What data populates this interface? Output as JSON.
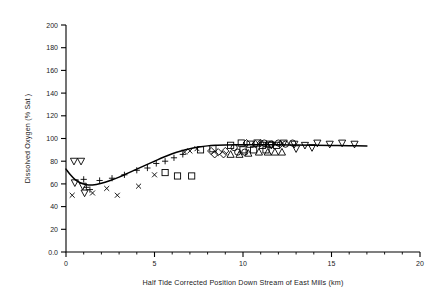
{
  "chart_data": {
    "type": "scatter",
    "title": "",
    "subtitle": "",
    "xlabel": "Half Tide Corrected Position Down Stream of East Mills (km)",
    "ylabel": "Dissolved Oxygen (% Sat )",
    "xlim": [
      0,
      20
    ],
    "ylim": [
      0,
      200
    ],
    "xticks": [
      0,
      5,
      10,
      15,
      20
    ],
    "xtick_labels": [
      "0",
      "5",
      "10",
      "15",
      "20"
    ],
    "yticks": [
      0,
      20,
      40,
      60,
      80,
      100,
      120,
      140,
      160,
      180,
      200
    ],
    "ytick_labels": [
      "0.0",
      "20-",
      "40-",
      "60-",
      "80-",
      "100-",
      "120-",
      "140-",
      "160-",
      "180-",
      "200-"
    ],
    "ytick_text": [
      "0.0",
      "20",
      "40",
      "60",
      "80",
      "100",
      "120",
      "140",
      "160",
      "180",
      "200"
    ],
    "grid": false,
    "legend": "none",
    "xminor_step": 1,
    "series": [
      {
        "name": "down-triangle",
        "marker": "triangle-down",
        "points": [
          [
            0.45,
            80
          ],
          [
            0.85,
            80
          ],
          [
            0.5,
            61
          ],
          [
            0.95,
            58
          ],
          [
            1.05,
            52
          ],
          [
            12.3,
            96
          ],
          [
            12.9,
            95
          ],
          [
            13.5,
            94
          ],
          [
            14.2,
            96
          ],
          [
            14.9,
            95
          ],
          [
            15.6,
            96
          ],
          [
            16.3,
            95
          ],
          [
            11.6,
            94
          ],
          [
            13.0,
            91
          ],
          [
            13.9,
            92
          ]
        ]
      },
      {
        "name": "plus",
        "marker": "plus",
        "points": [
          [
            1.0,
            64
          ],
          [
            1.15,
            57
          ],
          [
            1.35,
            55
          ],
          [
            1.9,
            63
          ],
          [
            2.6,
            65
          ],
          [
            3.3,
            68
          ],
          [
            4.0,
            72
          ],
          [
            4.6,
            74
          ],
          [
            5.1,
            78
          ],
          [
            5.6,
            80
          ],
          [
            6.1,
            83
          ],
          [
            6.6,
            86
          ]
        ]
      },
      {
        "name": "cross",
        "marker": "cross",
        "points": [
          [
            0.35,
            50
          ],
          [
            1.5,
            52
          ],
          [
            2.3,
            56
          ],
          [
            2.9,
            50
          ],
          [
            4.1,
            58
          ],
          [
            5.0,
            68
          ],
          [
            6.7,
            88
          ],
          [
            7.4,
            91
          ],
          [
            7.0,
            89
          ]
        ]
      },
      {
        "name": "square",
        "marker": "square",
        "points": [
          [
            5.6,
            70
          ],
          [
            6.3,
            67
          ],
          [
            7.1,
            67
          ],
          [
            7.6,
            90
          ],
          [
            8.3,
            91
          ],
          [
            9.3,
            94
          ],
          [
            9.9,
            96
          ],
          [
            10.4,
            95
          ],
          [
            10.8,
            96
          ],
          [
            11.1,
            94
          ],
          [
            11.5,
            95
          ],
          [
            11.9,
            94
          ],
          [
            10.0,
            90
          ],
          [
            10.6,
            90
          ],
          [
            11.3,
            90
          ]
        ]
      },
      {
        "name": "diamond",
        "marker": "diamond",
        "points": [
          [
            8.2,
            89
          ],
          [
            8.6,
            88
          ],
          [
            9.0,
            89
          ],
          [
            8.4,
            86
          ],
          [
            8.9,
            86
          ],
          [
            10.2,
            96
          ],
          [
            10.7,
            95
          ],
          [
            11.0,
            96
          ],
          [
            12.1,
            95
          ]
        ]
      },
      {
        "name": "circle",
        "marker": "circle",
        "points": [
          [
            9.5,
            92
          ],
          [
            9.7,
            88
          ],
          [
            10.1,
            88
          ],
          [
            11.2,
            96
          ],
          [
            11.6,
            95
          ],
          [
            12.0,
            96
          ],
          [
            12.4,
            95
          ],
          [
            12.8,
            96
          ]
        ]
      },
      {
        "name": "up-triangle",
        "marker": "triangle-up",
        "points": [
          [
            9.3,
            86
          ],
          [
            9.8,
            86
          ],
          [
            10.3,
            87
          ],
          [
            10.9,
            88
          ],
          [
            11.4,
            88
          ],
          [
            11.8,
            88
          ],
          [
            12.2,
            88
          ]
        ]
      }
    ],
    "trend_curve": {
      "name": "fitted-trend",
      "points": [
        [
          0.0,
          73
        ],
        [
          0.25,
          68
        ],
        [
          0.5,
          64
        ],
        [
          0.8,
          61
        ],
        [
          1.1,
          59.5
        ],
        [
          1.5,
          59
        ],
        [
          2.0,
          60.5
        ],
        [
          2.5,
          63
        ],
        [
          3.0,
          66
        ],
        [
          3.5,
          69.5
        ],
        [
          4.0,
          73
        ],
        [
          4.5,
          76.5
        ],
        [
          5.0,
          80
        ],
        [
          5.5,
          83.5
        ],
        [
          6.0,
          86.5
        ],
        [
          6.5,
          89
        ],
        [
          7.0,
          91
        ],
        [
          7.5,
          92.5
        ],
        [
          8.0,
          93.5
        ],
        [
          8.5,
          94
        ],
        [
          9.0,
          94.3
        ],
        [
          10.0,
          94.5
        ],
        [
          11.0,
          94.5
        ],
        [
          12.0,
          94.4
        ],
        [
          13.0,
          94.2
        ],
        [
          14.0,
          94.0
        ],
        [
          15.0,
          93.8
        ],
        [
          16.0,
          93.6
        ],
        [
          17.0,
          93.5
        ]
      ]
    }
  },
  "colors": {
    "background": "#ffffff",
    "axis": "#000000",
    "marker": "#000000",
    "trend": "#000000"
  }
}
